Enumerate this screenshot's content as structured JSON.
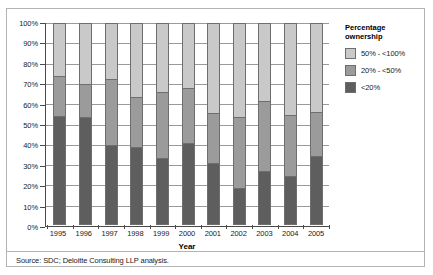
{
  "chart_data": {
    "type": "bar",
    "subtype": "stacked-100-percent",
    "title": "",
    "xlabel": "Year",
    "ylabel": "",
    "ylim": [
      0,
      100
    ],
    "yticks": [
      "0%",
      "10%",
      "20%",
      "30%",
      "40%",
      "50%",
      "60%",
      "70%",
      "80%",
      "90%",
      "100%"
    ],
    "grid": true,
    "legend_position": "right",
    "legend_title": "Percentage ownership",
    "categories": [
      "1995",
      "1996",
      "1997",
      "1998",
      "1999",
      "2000",
      "2001",
      "2002",
      "2003",
      "2004",
      "2005"
    ],
    "series": [
      {
        "name": "<20%",
        "color": "#5e5e5e",
        "values": [
          54.0,
          53.5,
          39.5,
          38.5,
          33.0,
          40.5,
          30.5,
          18.0,
          26.5,
          24.0,
          34.0
        ]
      },
      {
        "name": "20% - <50%",
        "color": "#9b9b9b",
        "values": [
          20.0,
          16.5,
          33.0,
          25.0,
          33.0,
          27.5,
          25.0,
          35.5,
          35.0,
          30.5,
          22.0
        ]
      },
      {
        "name": "50% - <100%",
        "color": "#c9c9c9",
        "values": [
          26.0,
          30.0,
          27.5,
          36.5,
          34.0,
          32.0,
          44.5,
          46.5,
          38.5,
          45.5,
          44.0
        ]
      }
    ],
    "cumulative_tops": {
      "dark": [
        54.0,
        53.5,
        39.5,
        38.5,
        33.0,
        40.5,
        30.5,
        18.0,
        26.5,
        24.0,
        34.0
      ],
      "mid": [
        74.0,
        70.0,
        72.5,
        63.5,
        66.0,
        68.0,
        55.5,
        53.5,
        61.5,
        54.5,
        56.0
      ]
    }
  },
  "legend": {
    "title_line1": "Percentage",
    "title_line2": "ownership",
    "items": [
      {
        "label": "50% - <100%",
        "color": "#c9c9c9"
      },
      {
        "label": "20% - <50%",
        "color": "#9b9b9b"
      },
      {
        "label": "<20%",
        "color": "#5e5e5e"
      }
    ]
  },
  "axis": {
    "x_title": "Year"
  },
  "footer": {
    "source": "Source: SDC; Deloitte Consulting LLP analysis."
  }
}
